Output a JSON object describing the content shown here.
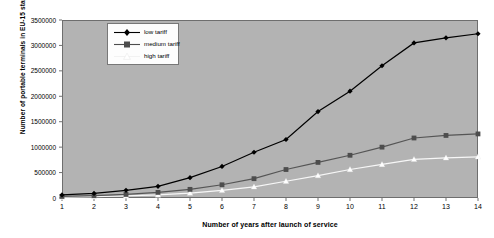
{
  "chart_data": {
    "type": "line",
    "title": "",
    "xlabel": "Number of years after launch of service",
    "ylabel": "Number of portable terminals in EU-15 state",
    "x": [
      1,
      2,
      3,
      4,
      5,
      6,
      7,
      8,
      9,
      10,
      11,
      12,
      13,
      14
    ],
    "xtick_labels": [
      "1",
      "2",
      "3",
      "4",
      "5",
      "6",
      "7",
      "8",
      "9",
      "10",
      "11",
      "12",
      "13",
      "14"
    ],
    "ytick_labels": [
      "0",
      "500000",
      "1000000",
      "1500000",
      "2000000",
      "2500000",
      "3000000",
      "3500000"
    ],
    "yticks": [
      0,
      500000,
      1000000,
      1500000,
      2000000,
      2500000,
      3000000,
      3500000
    ],
    "xlim": [
      1,
      14
    ],
    "ylim": [
      0,
      3500000
    ],
    "grid": false,
    "legend_position": "top-left",
    "series": [
      {
        "name": "low tariff",
        "marker": "diamond",
        "color": "#000000",
        "values": [
          60000,
          90000,
          150000,
          230000,
          400000,
          620000,
          900000,
          1150000,
          1700000,
          2100000,
          2600000,
          3050000,
          3150000,
          3230000
        ]
      },
      {
        "name": "medium tariff",
        "marker": "square",
        "color": "#555555",
        "values": [
          30000,
          45000,
          70000,
          110000,
          170000,
          260000,
          380000,
          560000,
          700000,
          840000,
          1000000,
          1180000,
          1230000,
          1260000
        ]
      },
      {
        "name": "high tariff",
        "marker": "triangle",
        "color": "#ffffff",
        "values": [
          15000,
          25000,
          40000,
          60000,
          95000,
          150000,
          220000,
          330000,
          440000,
          560000,
          660000,
          760000,
          790000,
          810000
        ]
      }
    ]
  },
  "legend": {
    "items": [
      {
        "label": "low  tariff"
      },
      {
        "label": "medium tariff"
      },
      {
        "label": "high tariff"
      }
    ]
  },
  "axes": {
    "plot_background": "#b3b3b3",
    "frame_color": "#6e6e6e"
  }
}
